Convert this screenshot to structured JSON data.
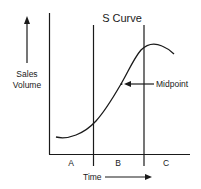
{
  "diagram": {
    "title": "S Curve",
    "y_axis_label_line1": "Sales",
    "y_axis_label_line2": "Volume",
    "x_axis_label": "Time",
    "annotation": "Midpoint",
    "phases": [
      "A",
      "B",
      "C"
    ],
    "colors": {
      "line": "#1a1a1a",
      "background": "#ffffff"
    }
  }
}
